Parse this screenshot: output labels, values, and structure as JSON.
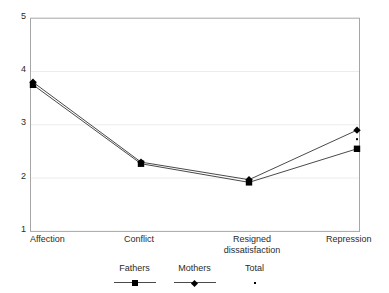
{
  "chart_data": {
    "type": "line",
    "title": "",
    "subtitle": "",
    "xlabel": "",
    "ylabel": "",
    "categories": [
      "Affection",
      "Conflict",
      "Resigned dissatisfaction",
      "Repression"
    ],
    "ylim": [
      1,
      5
    ],
    "yticks": [
      "1",
      "2",
      "3",
      "4",
      "5"
    ],
    "ytick_values": [
      1,
      2,
      3,
      4,
      5
    ],
    "grid": "horizontal-faint",
    "legend_position": "bottom",
    "series": [
      {
        "name": "Fathers",
        "marker": "square",
        "values": [
          3.75,
          2.27,
          1.92,
          2.55
        ],
        "color": "#000000"
      },
      {
        "name": "Mothers",
        "marker": "diamond",
        "values": [
          3.8,
          2.3,
          1.97,
          2.9
        ],
        "color": "#000000"
      },
      {
        "name": "Total",
        "marker": "dot",
        "values": [
          3.78,
          2.29,
          1.95,
          2.73
        ],
        "color": "#000000"
      }
    ]
  },
  "legend": {
    "items": [
      {
        "label": "Fathers",
        "key": "square-line-key"
      },
      {
        "label": "Mothers",
        "key": "diamond-line-key"
      },
      {
        "label": "Total",
        "key": "dot-key"
      }
    ]
  },
  "axis": {
    "y_top_label": "5",
    "y_label_4": "4",
    "y_label_3": "3",
    "y_label_2": "2",
    "y_bottom_label": "1",
    "x_label_1": "Affection",
    "x_label_2": "Conflict",
    "x_label_3": "Resigned\ndissatisfaction",
    "x_label_4": "Repression"
  },
  "colors": {
    "plot_border": "#9b9b9b",
    "gridline": "#e6e6e6",
    "series_line": "#4a4a4a",
    "marker": "#000000",
    "text": "#2b2b2b",
    "background": "#ffffff"
  }
}
